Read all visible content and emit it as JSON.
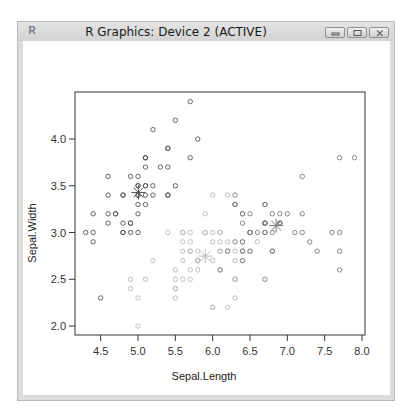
{
  "window": {
    "title": "R Graphics: Device 2 (ACTIVE)",
    "icon": "R",
    "buttons": [
      "minimize",
      "maximize",
      "close"
    ]
  },
  "chart_data": {
    "type": "scatter",
    "title": "",
    "xlabel": "Sepal.Length",
    "ylabel": "Sepal.Width",
    "xlim": [
      4.3,
      8.0
    ],
    "ylim": [
      2.0,
      4.4
    ],
    "x_ticks": [
      "4.5",
      "5.0",
      "5.5",
      "6.0",
      "6.5",
      "7.0",
      "7.5",
      "8.0"
    ],
    "y_ticks": [
      "2.0",
      "2.5",
      "3.0",
      "3.5",
      "4.0"
    ],
    "grid": false,
    "legend": null,
    "cluster_colors": [
      "#555555",
      "#b8b8b8",
      "#7a7a7a"
    ],
    "series": [
      {
        "name": "cluster 1",
        "color": "#555555",
        "points": [
          [
            5.1,
            3.5
          ],
          [
            4.9,
            3.0
          ],
          [
            4.7,
            3.2
          ],
          [
            4.6,
            3.1
          ],
          [
            5.0,
            3.6
          ],
          [
            5.4,
            3.9
          ],
          [
            4.6,
            3.4
          ],
          [
            5.0,
            3.4
          ],
          [
            4.4,
            2.9
          ],
          [
            4.9,
            3.1
          ],
          [
            5.4,
            3.7
          ],
          [
            4.8,
            3.4
          ],
          [
            4.8,
            3.0
          ],
          [
            4.3,
            3.0
          ],
          [
            5.8,
            4.0
          ],
          [
            5.7,
            4.4
          ],
          [
            5.4,
            3.9
          ],
          [
            5.1,
            3.5
          ],
          [
            5.7,
            3.8
          ],
          [
            5.1,
            3.8
          ],
          [
            5.4,
            3.4
          ],
          [
            5.1,
            3.7
          ],
          [
            4.6,
            3.6
          ],
          [
            5.1,
            3.3
          ],
          [
            4.8,
            3.4
          ],
          [
            5.0,
            3.0
          ],
          [
            5.0,
            3.4
          ],
          [
            5.2,
            3.5
          ],
          [
            5.2,
            3.4
          ],
          [
            4.7,
            3.2
          ],
          [
            4.8,
            3.1
          ],
          [
            5.4,
            3.4
          ],
          [
            5.2,
            4.1
          ],
          [
            5.5,
            4.2
          ],
          [
            4.9,
            3.1
          ],
          [
            5.0,
            3.2
          ],
          [
            5.5,
            3.5
          ],
          [
            4.9,
            3.6
          ],
          [
            4.4,
            3.0
          ],
          [
            5.1,
            3.4
          ],
          [
            5.0,
            3.5
          ],
          [
            4.5,
            2.3
          ],
          [
            4.4,
            3.2
          ],
          [
            5.0,
            3.5
          ],
          [
            5.1,
            3.8
          ],
          [
            4.8,
            3.0
          ],
          [
            5.1,
            3.8
          ],
          [
            4.6,
            3.2
          ],
          [
            5.3,
            3.7
          ],
          [
            5.0,
            3.3
          ]
        ]
      },
      {
        "name": "cluster 2",
        "color": "#b8b8b8",
        "points": [
          [
            5.5,
            2.3
          ],
          [
            5.7,
            2.8
          ],
          [
            6.3,
            3.3
          ],
          [
            4.9,
            2.4
          ],
          [
            6.6,
            2.9
          ],
          [
            5.2,
            2.7
          ],
          [
            5.0,
            2.0
          ],
          [
            5.9,
            3.0
          ],
          [
            6.0,
            2.2
          ],
          [
            6.1,
            2.9
          ],
          [
            5.6,
            2.9
          ],
          [
            5.6,
            3.0
          ],
          [
            5.8,
            2.7
          ],
          [
            6.2,
            2.2
          ],
          [
            5.6,
            2.5
          ],
          [
            5.9,
            3.2
          ],
          [
            6.1,
            2.8
          ],
          [
            6.3,
            2.5
          ],
          [
            6.1,
            2.8
          ],
          [
            6.4,
            2.9
          ],
          [
            6.0,
            2.9
          ],
          [
            5.7,
            2.6
          ],
          [
            5.5,
            2.4
          ],
          [
            5.5,
            2.4
          ],
          [
            5.8,
            2.7
          ],
          [
            6.0,
            2.7
          ],
          [
            5.4,
            3.0
          ],
          [
            6.0,
            3.4
          ],
          [
            6.3,
            2.3
          ],
          [
            5.6,
            3.0
          ],
          [
            5.5,
            2.5
          ],
          [
            5.5,
            2.6
          ],
          [
            6.1,
            3.0
          ],
          [
            5.8,
            2.6
          ],
          [
            5.0,
            2.3
          ],
          [
            5.6,
            2.7
          ],
          [
            5.7,
            3.0
          ],
          [
            5.7,
            2.9
          ],
          [
            6.2,
            2.9
          ],
          [
            5.1,
            2.5
          ],
          [
            5.7,
            2.8
          ],
          [
            5.8,
            2.7
          ],
          [
            4.9,
            2.5
          ],
          [
            5.7,
            2.5
          ],
          [
            5.8,
            2.8
          ],
          [
            6.4,
            2.7
          ],
          [
            6.5,
            3.0
          ],
          [
            6.0,
            2.2
          ],
          [
            5.6,
            2.8
          ],
          [
            6.3,
            2.7
          ],
          [
            6.2,
            2.8
          ],
          [
            6.1,
            3.0
          ],
          [
            6.3,
            2.8
          ],
          [
            6.1,
            2.6
          ],
          [
            6.3,
            2.5
          ],
          [
            6.0,
            3.0
          ],
          [
            5.8,
            2.7
          ],
          [
            6.3,
            2.5
          ],
          [
            5.9,
            3.0
          ],
          [
            6.5,
            2.8
          ],
          [
            6.2,
            3.4
          ]
        ]
      },
      {
        "name": "cluster 3",
        "color": "#7a7a7a",
        "points": [
          [
            7.0,
            3.2
          ],
          [
            6.4,
            3.2
          ],
          [
            6.9,
            3.1
          ],
          [
            6.5,
            2.8
          ],
          [
            6.7,
            3.1
          ],
          [
            6.3,
            3.3
          ],
          [
            6.7,
            3.0
          ],
          [
            6.8,
            2.8
          ],
          [
            6.7,
            3.1
          ],
          [
            7.1,
            3.0
          ],
          [
            6.3,
            2.9
          ],
          [
            6.5,
            3.0
          ],
          [
            7.6,
            3.0
          ],
          [
            7.3,
            2.9
          ],
          [
            6.7,
            2.5
          ],
          [
            7.2,
            3.6
          ],
          [
            6.5,
            3.2
          ],
          [
            6.4,
            2.7
          ],
          [
            6.8,
            3.0
          ],
          [
            6.4,
            3.2
          ],
          [
            6.5,
            3.0
          ],
          [
            7.7,
            3.8
          ],
          [
            7.7,
            2.6
          ],
          [
            6.9,
            3.2
          ],
          [
            7.7,
            2.8
          ],
          [
            6.7,
            3.3
          ],
          [
            7.2,
            3.2
          ],
          [
            6.2,
            2.8
          ],
          [
            6.4,
            2.8
          ],
          [
            7.2,
            3.0
          ],
          [
            7.4,
            2.8
          ],
          [
            7.9,
            3.8
          ],
          [
            6.4,
            2.8
          ],
          [
            6.1,
            2.6
          ],
          [
            7.7,
            3.0
          ],
          [
            6.3,
            3.4
          ],
          [
            6.4,
            3.1
          ],
          [
            6.9,
            3.1
          ],
          [
            6.7,
            3.1
          ],
          [
            6.9,
            3.1
          ],
          [
            6.8,
            3.2
          ],
          [
            6.7,
            3.3
          ],
          [
            6.7,
            3.0
          ],
          [
            6.6,
            3.0
          ],
          [
            6.8,
            2.8
          ],
          [
            6.5,
            3.0
          ],
          [
            6.4,
            2.9
          ],
          [
            6.3,
            3.3
          ],
          [
            6.7,
            3.1
          ]
        ]
      }
    ],
    "centers": [
      [
        5.006,
        3.428
      ],
      [
        5.9016,
        2.748
      ],
      [
        6.85,
        3.0737
      ]
    ],
    "center_marker": "asterisk"
  }
}
